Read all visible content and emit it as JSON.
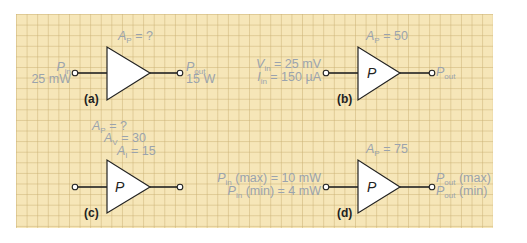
{
  "colors": {
    "grid_background": "#f6e6b8",
    "grid_lines": "#cdb478",
    "label_text": "#9aa3ad",
    "wire": "#222222",
    "triangle_fill": "#ffffff"
  },
  "figures": [
    {
      "id": "a",
      "tag": "(a)",
      "gain_labels": [
        {
          "sym": "A",
          "sub": "P",
          "rest": " = ?"
        }
      ],
      "triangle_label": "",
      "input": {
        "lines": [
          {
            "sym": "P",
            "sub": "in",
            "rest": ""
          },
          {
            "sym": "",
            "sub": "",
            "rest": "25 mW"
          }
        ]
      },
      "output": {
        "lines": [
          {
            "sym": "P",
            "sub": "out",
            "rest": ""
          },
          {
            "sym": "",
            "sub": "",
            "rest": "15 W"
          }
        ]
      }
    },
    {
      "id": "b",
      "tag": "(b)",
      "gain_labels": [
        {
          "sym": "A",
          "sub": "P",
          "rest": " = 50"
        }
      ],
      "triangle_label": "P",
      "input": {
        "lines": [
          {
            "sym": "V",
            "sub": "in",
            "rest": " = 25 mV"
          },
          {
            "sym": "I",
            "sub": "in",
            "rest": " = 150 µA"
          }
        ]
      },
      "output": {
        "lines": [
          {
            "sym": "P",
            "sub": "out",
            "rest": ""
          }
        ]
      }
    },
    {
      "id": "c",
      "tag": "(c)",
      "gain_labels": [
        {
          "sym": "A",
          "sub": "P",
          "rest": " = ?"
        },
        {
          "sym": "A",
          "sub": "V",
          "rest": " = 30"
        },
        {
          "sym": "A",
          "sub": "I",
          "rest": " = 15"
        }
      ],
      "triangle_label": "P",
      "input": {
        "lines": []
      },
      "output": {
        "lines": []
      }
    },
    {
      "id": "d",
      "tag": "(d)",
      "gain_labels": [
        {
          "sym": "A",
          "sub": "P",
          "rest": " = 75"
        }
      ],
      "triangle_label": "P",
      "input": {
        "lines": [
          {
            "sym": "P",
            "sub": "in",
            "rest": " (max) = 10 mW"
          },
          {
            "sym": "P",
            "sub": "in",
            "rest": " (min) = 4 mW"
          }
        ]
      },
      "output": {
        "lines": [
          {
            "sym": "P",
            "sub": "out",
            "rest": " (max)"
          },
          {
            "sym": "P",
            "sub": "out",
            "rest": " (min)"
          }
        ]
      }
    }
  ]
}
